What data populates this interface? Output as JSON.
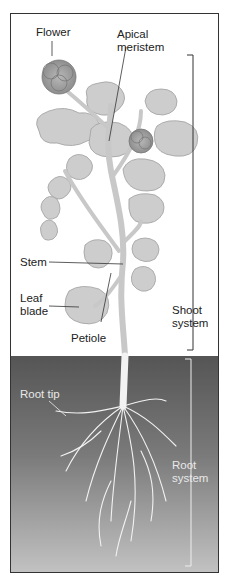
{
  "diagram": {
    "type": "plant anatomy illustration",
    "labels": {
      "flower": "Flower",
      "apical_meristem_line1": "Apical",
      "apical_meristem_line2": "meristem",
      "stem": "Stem",
      "leaf_blade_line1": "Leaf",
      "leaf_blade_line2": "blade",
      "petiole": "Petiole",
      "shoot_system_line1": "Shoot",
      "shoot_system_line2": "system",
      "root_tip": "Root tip",
      "root_system_line1": "Root",
      "root_system_line2": "system"
    },
    "colors": {
      "frame": "#333333",
      "leaf_fill": "#c9c9c9",
      "leaf_stroke": "#9a9a9a",
      "flower_fill": "#a8a8a8",
      "stem": "#d4d4d4",
      "soil_top": "#5a5a5a",
      "soil_bottom": "#bdbdbd",
      "root": "#f0f0f0"
    }
  }
}
